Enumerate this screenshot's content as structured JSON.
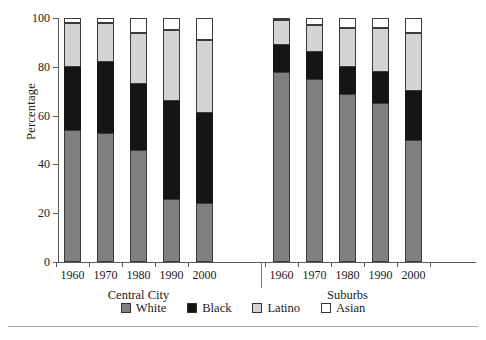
{
  "chart_data": {
    "type": "bar",
    "title": "",
    "xlabel": "",
    "ylabel": "Percentage",
    "ylim": [
      0,
      100
    ],
    "yticks": [
      0,
      20,
      40,
      60,
      80,
      100
    ],
    "grid": false,
    "stacked": true,
    "stack_mode": "percent",
    "legend_position": "bottom",
    "groups": [
      "Central City",
      "Suburbs"
    ],
    "categories": [
      "1960",
      "1970",
      "1980",
      "1990",
      "2000",
      "1960",
      "1970",
      "1980",
      "1990",
      "2000"
    ],
    "series": [
      {
        "name": "White",
        "color": "#808080",
        "values": [
          54,
          53,
          46,
          26,
          24,
          78,
          75,
          69,
          65,
          50
        ]
      },
      {
        "name": "Black",
        "color": "#151515",
        "values": [
          26,
          29,
          27,
          40,
          37,
          11,
          11,
          11,
          13,
          20
        ]
      },
      {
        "name": "Latino",
        "color": "#d4d4d4",
        "values": [
          18,
          16,
          21,
          29,
          30,
          10,
          11,
          16,
          18,
          24
        ]
      },
      {
        "name": "Asian",
        "color": "#ffffff",
        "values": [
          2,
          2,
          6,
          5,
          9,
          1,
          3,
          4,
          4,
          6
        ]
      }
    ],
    "cumulative_tops": {
      "white": [
        54,
        53,
        46,
        26,
        24,
        78,
        75,
        69,
        65,
        50
      ],
      "black": [
        80,
        82,
        73,
        66,
        61,
        89,
        86,
        80,
        78,
        70
      ],
      "latino": [
        98,
        98,
        94,
        95,
        91,
        99,
        97,
        96,
        96,
        94
      ],
      "asian": [
        100,
        100,
        100,
        100,
        100,
        100,
        100,
        100,
        100,
        100
      ]
    }
  },
  "axis": {
    "y_title": "Percentage",
    "y_tick_labels": [
      "0",
      "20",
      "40",
      "60",
      "80",
      "100"
    ],
    "x_tick_labels": [
      "1960",
      "1970",
      "1980",
      "1990",
      "2000",
      "1960",
      "1970",
      "1980",
      "1990",
      "2000"
    ]
  },
  "group_labels": [
    {
      "text": "Central City"
    },
    {
      "text": "Suburbs"
    }
  ],
  "legend": {
    "items": [
      {
        "label": "White",
        "color": "#808080"
      },
      {
        "label": "Black",
        "color": "#151515"
      },
      {
        "label": "Latino",
        "color": "#d4d4d4"
      },
      {
        "label": "Asian",
        "color": "#ffffff"
      }
    ]
  }
}
